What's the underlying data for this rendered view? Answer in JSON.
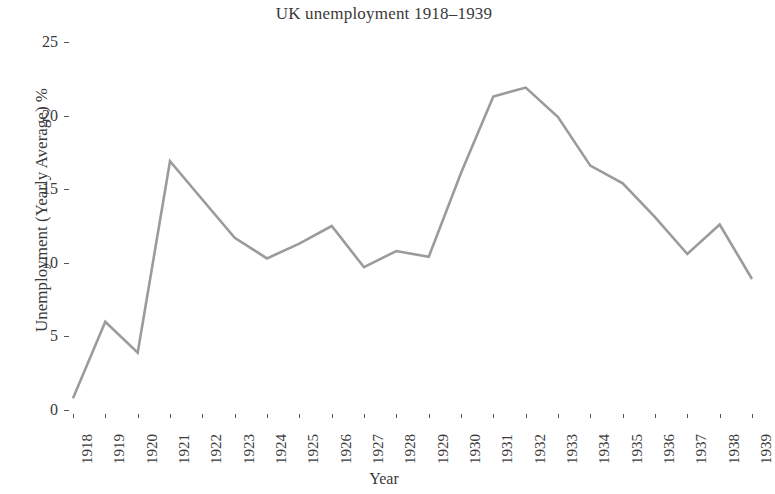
{
  "chart_data": {
    "type": "line",
    "title": "UK unemployment 1918–1939",
    "xlabel": "Year",
    "ylabel": "Unemployment (Yearly Average) %",
    "grid": false,
    "legend": null,
    "legend_position": "none",
    "line_color": "#9b9b9b",
    "axis_color": "#555555",
    "text_color": "#3a3a3a",
    "background": "#ffffff",
    "xlim": [
      1918,
      1939
    ],
    "ylim": [
      0,
      25
    ],
    "ytick_labels": [
      "25",
      "20",
      "15",
      "10",
      "5",
      "0"
    ],
    "yticks": [
      25,
      20,
      15,
      10,
      5,
      0
    ],
    "categories": [
      "1918",
      "1919",
      "1920",
      "1921",
      "1922",
      "1923",
      "1924",
      "1925",
      "1926",
      "1927",
      "1928",
      "1929",
      "1930",
      "1931",
      "1932",
      "1933",
      "1934",
      "1935",
      "1936",
      "1937",
      "1938",
      "1939"
    ],
    "x": [
      1918,
      1919,
      1920,
      1921,
      1922,
      1923,
      1924,
      1925,
      1926,
      1927,
      1928,
      1929,
      1930,
      1931,
      1932,
      1933,
      1934,
      1935,
      1936,
      1937,
      1938,
      1939
    ],
    "values": [
      0.8,
      6.0,
      3.9,
      16.9,
      14.3,
      11.7,
      10.3,
      11.3,
      12.5,
      9.7,
      10.8,
      10.4,
      16.1,
      21.3,
      21.9,
      19.9,
      16.6,
      15.4,
      13.1,
      10.6,
      12.6,
      8.9
    ],
    "series": [
      {
        "name": "Unemployment (Yearly Average) %",
        "values": [
          0.8,
          6.0,
          3.9,
          16.9,
          14.3,
          11.7,
          10.3,
          11.3,
          12.5,
          9.7,
          10.8,
          10.4,
          16.1,
          21.3,
          21.9,
          19.9,
          16.6,
          15.4,
          13.1,
          10.6,
          12.6,
          8.9
        ]
      }
    ]
  }
}
